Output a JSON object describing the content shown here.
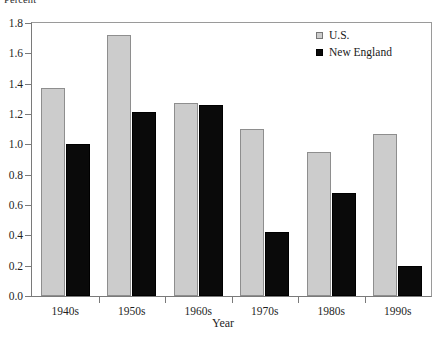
{
  "chart_data": {
    "type": "bar",
    "title": "",
    "xlabel": "Year",
    "ylabel": "Percent",
    "categories": [
      "1940s",
      "1950s",
      "1960s",
      "1970s",
      "1980s",
      "1990s"
    ],
    "series": [
      {
        "name": "U.S.",
        "color": "#cccccc",
        "values": [
          1.37,
          1.72,
          1.27,
          1.1,
          0.95,
          1.07
        ]
      },
      {
        "name": "New England",
        "color": "#0a0a0a",
        "values": [
          1.0,
          1.21,
          1.26,
          0.42,
          0.68,
          0.2
        ]
      }
    ],
    "ylim": [
      0.0,
      1.8
    ],
    "ytick_step": 0.2,
    "ytick_labels": [
      "0.0",
      "0.2",
      "0.4",
      "0.6",
      "0.8",
      "1.0",
      "1.2",
      "1.4",
      "1.6",
      "1.8"
    ],
    "grid": false,
    "legend_position": "top-right",
    "legend_entries": [
      "U.S.",
      "New England"
    ]
  },
  "axes": {
    "y_caption_clipped": "Percent",
    "x_title": "Year"
  }
}
